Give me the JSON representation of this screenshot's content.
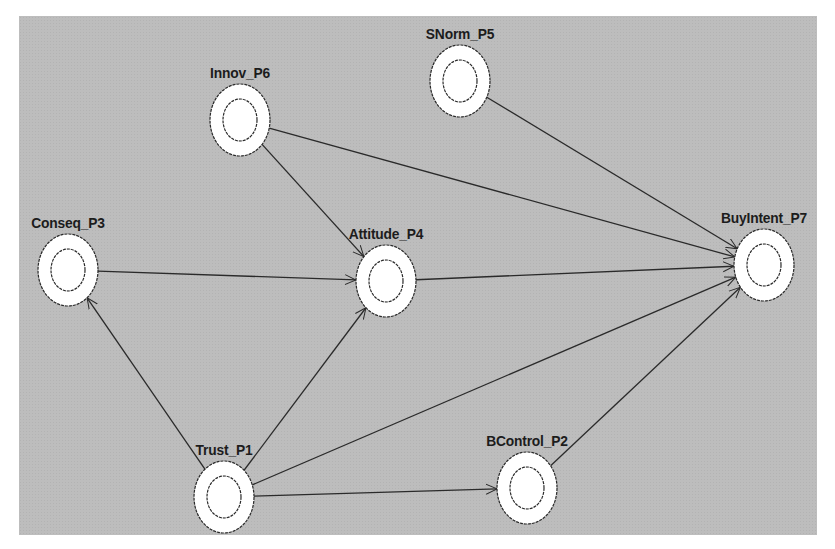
{
  "diagram": {
    "type": "path-model",
    "background_color": "#bdbdbd",
    "node_fill": "#ffffff",
    "stroke_color": "#2a2a2a",
    "nodes": [
      {
        "id": "Innov_P6",
        "label": "Innov_P6",
        "cx": 240,
        "cy": 120
      },
      {
        "id": "SNorm_P5",
        "label": "SNorm_P5",
        "cx": 460,
        "cy": 81
      },
      {
        "id": "Conseq_P3",
        "label": "Conseq_P3",
        "cx": 68,
        "cy": 270
      },
      {
        "id": "Attitude_P4",
        "label": "Attitude_P4",
        "cx": 386,
        "cy": 281
      },
      {
        "id": "BuyIntent_P7",
        "label": "BuyIntent_P7",
        "cx": 764,
        "cy": 265
      },
      {
        "id": "Trust_P1",
        "label": "Trust_P1",
        "cx": 224,
        "cy": 497
      },
      {
        "id": "BControl_P2",
        "label": "BControl_P2",
        "cx": 527,
        "cy": 488
      }
    ],
    "edges": [
      {
        "from": "Innov_P6",
        "to": "Attitude_P4"
      },
      {
        "from": "Innov_P6",
        "to": "BuyIntent_P7"
      },
      {
        "from": "SNorm_P5",
        "to": "BuyIntent_P7"
      },
      {
        "from": "Conseq_P3",
        "to": "Attitude_P4"
      },
      {
        "from": "Attitude_P4",
        "to": "BuyIntent_P7"
      },
      {
        "from": "Trust_P1",
        "to": "Conseq_P3"
      },
      {
        "from": "Trust_P1",
        "to": "Attitude_P4"
      },
      {
        "from": "Trust_P1",
        "to": "BuyIntent_P7"
      },
      {
        "from": "Trust_P1",
        "to": "BControl_P2"
      },
      {
        "from": "BControl_P2",
        "to": "BuyIntent_P7"
      }
    ]
  }
}
